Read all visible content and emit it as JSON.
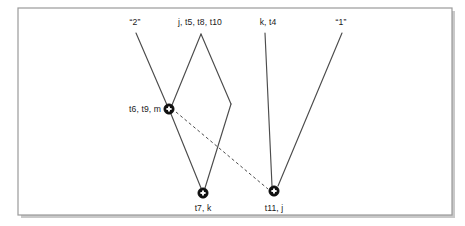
{
  "figure": {
    "title": "",
    "frame": {
      "x": 18,
      "y": 8,
      "width": 434,
      "height": 207,
      "border_color": "#9a9a9a",
      "shadow_color": "#c9c9c9"
    },
    "background_color": "#ffffff",
    "line_color": "#4c4c4c",
    "node_color": "#111111",
    "text_color": "#1a1a1a"
  },
  "top_labels": [
    {
      "id": "label-2",
      "text": "“2”",
      "x": 135,
      "y": 25
    },
    {
      "id": "label-j-t5-t8-t10",
      "text": "j, t5, t8, t10",
      "x": 200,
      "y": 25
    },
    {
      "id": "label-k-t4",
      "text": "k, t4",
      "x": 268,
      "y": 25
    },
    {
      "id": "label-1",
      "text": "“1”",
      "x": 341,
      "y": 25
    }
  ],
  "nodes": [
    {
      "id": "node-t6-t9-m",
      "label": "t6, t9, m",
      "x": 169,
      "y": 109,
      "label_x": 161,
      "label_y": 112,
      "label_anchor": "end",
      "marker": "filled-circle-plus"
    },
    {
      "id": "node-t7-k",
      "label": "t7, k",
      "x": 203,
      "y": 193,
      "label_x": 203,
      "label_y": 211,
      "label_anchor": "middle",
      "marker": "filled-circle-plus"
    },
    {
      "id": "node-t11-j",
      "label": "t11, j",
      "x": 274,
      "y": 191,
      "label_x": 274,
      "label_y": 211,
      "label_anchor": "middle",
      "marker": "filled-circle-plus"
    }
  ],
  "edges": [
    {
      "id": "edge-2-to-t6",
      "style": "solid",
      "x1": 136,
      "y1": 33,
      "x2": 167,
      "y2": 105
    },
    {
      "id": "edge-j-apex-to-t6",
      "style": "solid",
      "x1": 201,
      "y1": 34,
      "x2": 172,
      "y2": 105
    },
    {
      "id": "edge-j-apex-to-t7",
      "style": "solid",
      "x1": 201,
      "y1": 34,
      "x2": 231,
      "y2": 104
    },
    {
      "id": "edge-j-crossing-to-t7",
      "style": "solid",
      "x1": 231,
      "y1": 104,
      "x2": 205,
      "y2": 188
    },
    {
      "id": "edge-t6-to-t7",
      "style": "solid",
      "x1": 171,
      "y1": 114,
      "x2": 201,
      "y2": 188
    },
    {
      "id": "edge-k-t4-to-t11",
      "style": "solid",
      "x1": 265,
      "y1": 33,
      "x2": 272,
      "y2": 186
    },
    {
      "id": "edge-1-to-t11",
      "style": "solid",
      "x1": 342,
      "y1": 33,
      "x2": 278,
      "y2": 186
    },
    {
      "id": "edge-t6-to-t11-dashed",
      "style": "dashed",
      "x1": 176,
      "y1": 112,
      "x2": 268,
      "y2": 189
    }
  ],
  "node_marker": {
    "radius": 5.2,
    "cross_arm": 2.6,
    "description": "filled black disc with white plus sign"
  }
}
